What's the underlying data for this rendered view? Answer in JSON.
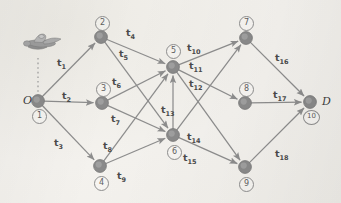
{
  "figure": {
    "type": "network-diagram",
    "title": "",
    "background_color": "#f2f0ec",
    "node_color": "#8a8a8a",
    "edge_color": "#8d8d8d",
    "label_color": "#4a4a4a"
  },
  "icons": {
    "airplane": "airplane-icon",
    "dotted_connector": "dotted-line"
  },
  "nodes": [
    {
      "id": "1",
      "number": "1",
      "name": "O",
      "x": 38,
      "y": 101,
      "ring_x": 32,
      "ring_y": 109,
      "big_label": "O",
      "big_x": 23,
      "big_y": 94
    },
    {
      "id": "2",
      "number": "2",
      "name": "",
      "x": 101,
      "y": 37,
      "ring_x": 95,
      "ring_y": 16,
      "big_label": "",
      "big_x": 0,
      "big_y": 0
    },
    {
      "id": "3",
      "number": "3",
      "name": "",
      "x": 102,
      "y": 103,
      "ring_x": 96,
      "ring_y": 82,
      "big_label": "",
      "big_x": 0,
      "big_y": 0
    },
    {
      "id": "4",
      "number": "4",
      "name": "",
      "x": 100,
      "y": 166,
      "ring_x": 94,
      "ring_y": 176,
      "big_label": "",
      "big_x": 0,
      "big_y": 0
    },
    {
      "id": "5",
      "number": "5",
      "name": "",
      "x": 173,
      "y": 67,
      "ring_x": 166,
      "ring_y": 44,
      "big_label": "",
      "big_x": 0,
      "big_y": 0
    },
    {
      "id": "6",
      "number": "6",
      "name": "",
      "x": 173,
      "y": 135,
      "ring_x": 167,
      "ring_y": 145,
      "big_label": "",
      "big_x": 0,
      "big_y": 0
    },
    {
      "id": "7",
      "number": "7",
      "name": "",
      "x": 246,
      "y": 38,
      "ring_x": 239,
      "ring_y": 16,
      "big_label": "",
      "big_x": 0,
      "big_y": 0
    },
    {
      "id": "8",
      "number": "8",
      "name": "",
      "x": 245,
      "y": 103,
      "ring_x": 239,
      "ring_y": 82,
      "big_label": "",
      "big_x": 0,
      "big_y": 0
    },
    {
      "id": "9",
      "number": "9",
      "name": "",
      "x": 245,
      "y": 167,
      "ring_x": 239,
      "ring_y": 177,
      "big_label": "",
      "big_x": 0,
      "big_y": 0
    },
    {
      "id": "10",
      "number": "10",
      "name": "D",
      "x": 310,
      "y": 102,
      "ring_x": 303,
      "ring_y": 110,
      "big_label": "D",
      "big_x": 322,
      "big_y": 95
    }
  ],
  "edges": [
    {
      "label": "t1",
      "sub": "1",
      "from": "1",
      "to": "2",
      "lx": 57,
      "ly": 57
    },
    {
      "label": "t2",
      "sub": "2",
      "from": "1",
      "to": "3",
      "lx": 62,
      "ly": 90
    },
    {
      "label": "t3",
      "sub": "3",
      "from": "1",
      "to": "4",
      "lx": 54,
      "ly": 137
    },
    {
      "label": "t4",
      "sub": "4",
      "from": "2",
      "to": "5",
      "lx": 126,
      "ly": 27
    },
    {
      "label": "t5",
      "sub": "5",
      "from": "2",
      "to": "6",
      "lx": 119,
      "ly": 48
    },
    {
      "label": "t6",
      "sub": "6",
      "from": "3",
      "to": "5",
      "lx": 112,
      "ly": 76
    },
    {
      "label": "t7",
      "sub": "7",
      "from": "3",
      "to": "6",
      "lx": 111,
      "ly": 113
    },
    {
      "label": "t8",
      "sub": "8",
      "from": "4",
      "to": "5",
      "lx": 103,
      "ly": 140
    },
    {
      "label": "t9",
      "sub": "9",
      "from": "4",
      "to": "6",
      "lx": 117,
      "ly": 170
    },
    {
      "label": "t10",
      "sub": "10",
      "from": "5",
      "to": "7",
      "lx": 187,
      "ly": 42
    },
    {
      "label": "t11",
      "sub": "11",
      "from": "5",
      "to": "8",
      "lx": 189,
      "ly": 60
    },
    {
      "label": "t12",
      "sub": "12",
      "from": "5",
      "to": "9",
      "lx": 189,
      "ly": 78
    },
    {
      "label": "t13",
      "sub": "13",
      "from": "6",
      "to": "5",
      "lx": 161,
      "ly": 104
    },
    {
      "label": "t14",
      "sub": "14",
      "from": "6",
      "to": "7",
      "lx": 187,
      "ly": 131
    },
    {
      "label": "t15",
      "sub": "15",
      "from": "6",
      "to": "9",
      "lx": 183,
      "ly": 152
    },
    {
      "label": "t16",
      "sub": "16",
      "from": "7",
      "to": "10",
      "lx": 275,
      "ly": 52
    },
    {
      "label": "t17",
      "sub": "17",
      "from": "8",
      "to": "10",
      "lx": 273,
      "ly": 89
    },
    {
      "label": "t18",
      "sub": "18",
      "from": "9",
      "to": "10",
      "lx": 275,
      "ly": 148
    }
  ]
}
